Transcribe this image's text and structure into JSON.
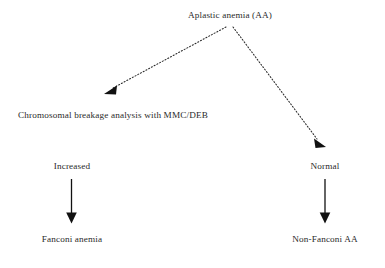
{
  "diagram": {
    "title_text": "Aplastic anemia (AA)",
    "ink_color": "#2a2a2a",
    "background_color": "#ffffff",
    "nodes": {
      "root": "Aplastic anemia (AA)",
      "test": "Chromosomal breakage analysis with MMC/DEB",
      "left_result": "Increased",
      "right_result": "Normal",
      "left_outcome": "Fanconi anemia",
      "right_outcome": "Non-Fanconi AA"
    },
    "edges": [
      {
        "name": "root-to-test",
        "style": "dotted",
        "from": "Aplastic anemia (AA)",
        "to": "Chromosomal breakage analysis with MMC/DEB"
      },
      {
        "name": "root-to-normal",
        "style": "dotted",
        "from": "Aplastic anemia (AA)",
        "to": "Normal"
      },
      {
        "name": "increased-to-fanconi",
        "style": "solid",
        "from": "Increased",
        "to": "Fanconi anemia"
      },
      {
        "name": "normal-to-nonfanconi",
        "style": "solid",
        "from": "Normal",
        "to": "Non-Fanconi AA"
      }
    ]
  }
}
